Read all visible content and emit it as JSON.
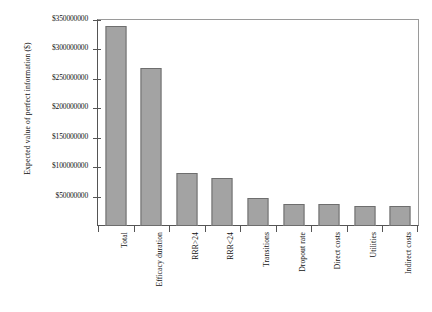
{
  "chart_data": {
    "type": "bar",
    "title": "",
    "xlabel": "",
    "ylabel": "Expected value of perfect information ($)",
    "ylim": [
      0,
      350000000
    ],
    "grid": false,
    "legend": "none",
    "categories": [
      "Total",
      "Efficacy duration",
      "RRR>24",
      "RRR<24",
      "Transitions",
      "Dropout rate",
      "Direct costs",
      "Utilities",
      "Indirect costs"
    ],
    "values": [
      340000000,
      268000000,
      90000000,
      82000000,
      47000000,
      38000000,
      37000000,
      34000000,
      34000000
    ],
    "ytick_values": [
      50000000,
      100000000,
      150000000,
      200000000,
      250000000,
      300000000,
      350000000
    ],
    "ytick_labels": [
      "$50000000",
      "$100000000",
      "$150000000",
      "$200000000",
      "$250000000",
      "$300000000",
      "$350000000"
    ],
    "bar_color": "#a3a3a3",
    "bar_border_color": "#6e6e6e",
    "axis_color": "#555555"
  }
}
